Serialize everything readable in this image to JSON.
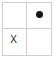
{
  "figure": {
    "name": "two-by-two-grid",
    "rows": 2,
    "columns": 2,
    "border_color": "#cfcfcf",
    "grid_line_color": "#cfcfcf",
    "background_color": "#ffffff",
    "marker_color": "#151515"
  },
  "cells": [
    {
      "id": "cell-top-left",
      "row": 1,
      "column": 1,
      "marker": "",
      "marker_type": "empty"
    },
    {
      "id": "cell-top-right",
      "row": 1,
      "column": 2,
      "marker": "●",
      "marker_type": "dot"
    },
    {
      "id": "cell-bottom-left",
      "row": 2,
      "column": 1,
      "marker": "X",
      "marker_type": "x"
    },
    {
      "id": "cell-bottom-right",
      "row": 2,
      "column": 2,
      "marker": "",
      "marker_type": "empty"
    }
  ]
}
